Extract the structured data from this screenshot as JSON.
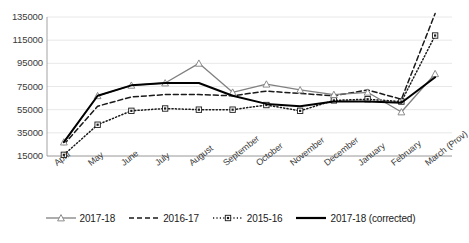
{
  "chart_data": {
    "type": "line",
    "title": "",
    "xlabel": "",
    "ylabel": "",
    "grid": true,
    "legend_position": "bottom",
    "ylim": [
      15000,
      135000
    ],
    "yticks": [
      15000,
      35000,
      55000,
      75000,
      95000,
      115000,
      135000
    ],
    "ytick_labels": [
      "15000",
      "35000",
      "55000",
      "75000",
      "95000",
      "115000",
      "135000"
    ],
    "categories": [
      "April",
      "May",
      "June",
      "July",
      "August",
      "September",
      "October",
      "November",
      "December",
      "January",
      "February",
      "March (Prov)"
    ],
    "series": [
      {
        "name": "2017-18",
        "style": "solid",
        "color": "#808080",
        "marker": "triangle",
        "values": [
          27000,
          67000,
          76000,
          78000,
          95000,
          70000,
          77000,
          72000,
          68000,
          70000,
          53000,
          86000
        ]
      },
      {
        "name": "2016-17",
        "style": "dashed",
        "color": "#1a1a1a",
        "marker": "none",
        "values": [
          25000,
          58000,
          66000,
          68000,
          68000,
          67000,
          71000,
          69000,
          67000,
          72000,
          64000,
          138000
        ]
      },
      {
        "name": "2015-16",
        "style": "dotted",
        "color": "#1a1a1a",
        "marker": "square",
        "values": [
          16000,
          42000,
          54000,
          56000,
          55000,
          55000,
          59000,
          54000,
          63000,
          64000,
          62000,
          119000
        ]
      },
      {
        "name": "2017-18 (corrected)",
        "style": "solid",
        "color": "#000000",
        "marker": "none",
        "values": [
          27000,
          67000,
          76000,
          78000,
          78000,
          67000,
          60000,
          58000,
          62000,
          62000,
          61000,
          83000
        ]
      }
    ]
  },
  "legend": {
    "items": [
      {
        "label": "2017-18"
      },
      {
        "label": "2016-17"
      },
      {
        "label": "2015-16"
      },
      {
        "label": "2017-18 (corrected)"
      }
    ]
  },
  "caption": {
    "text": ""
  }
}
